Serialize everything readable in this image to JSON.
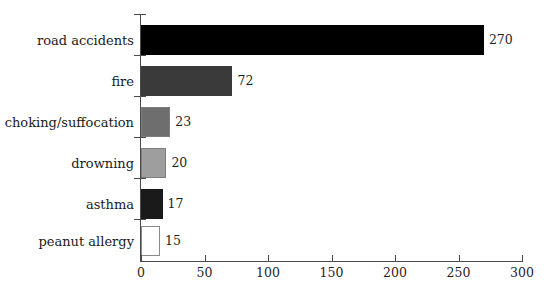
{
  "chart_data": {
    "type": "bar",
    "orientation": "horizontal",
    "title": "",
    "subtitle": "",
    "xlabel": "",
    "ylabel": "",
    "categories": [
      "road accidents",
      "fire",
      "choking/suffocation",
      "drowning",
      "asthma",
      "peanut allergy"
    ],
    "values": [
      270,
      72,
      23,
      20,
      17,
      15
    ],
    "value_labels": [
      "270",
      "72",
      "23",
      "20",
      "17",
      "15"
    ],
    "bar_colors": [
      "#000000",
      "#3a3a3a",
      "#6e6e6e",
      "#9e9e9e",
      "#1a1a1a",
      "#ffffff"
    ],
    "bar_styles": [
      "plain",
      "plain",
      "edged",
      "edged",
      "plain",
      "outlined"
    ],
    "xlim": [
      0,
      300
    ],
    "xticks": [
      0,
      50,
      100,
      150,
      200,
      250,
      300
    ],
    "xtick_labels": [
      "0",
      "50",
      "100",
      "150",
      "200",
      "250",
      "300"
    ],
    "grid": false,
    "legend": null,
    "axis_color": "#4a4a4a",
    "background": "#ffffff"
  }
}
